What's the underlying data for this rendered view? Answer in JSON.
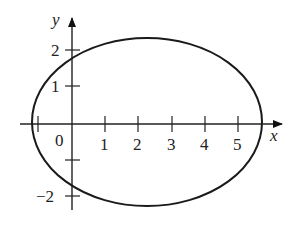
{
  "diagram": {
    "type": "ellipse-on-axes",
    "axes": {
      "x_label": "x",
      "y_label": "y",
      "origin_label": "0",
      "x_ticks": [
        "1",
        "2",
        "3",
        "4",
        "5"
      ],
      "y_ticks_pos": [
        "1",
        "2"
      ],
      "y_ticks_neg": [
        "−2"
      ]
    },
    "curve": {
      "shape": "ellipse",
      "center": [
        2.25,
        0
      ],
      "x_range": [
        -1.2,
        5.7
      ],
      "y_range": [
        -2.3,
        2.3
      ]
    }
  }
}
